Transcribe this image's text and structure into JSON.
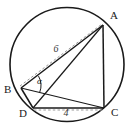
{
  "figure": {
    "type": "cyclic-quadrilateral-inscribed-in-circle",
    "background_color": "#ffffff",
    "stroke_color": "#1a1a1a",
    "dashed_color": "#8a8a8a",
    "circle": {
      "center_x": 67,
      "center_y": 64.5,
      "radius": 57
    },
    "vertices": [
      {
        "id": "A",
        "label": "A",
        "x": 103,
        "y": 25,
        "label_x": 110,
        "label_y": 19
      },
      {
        "id": "B",
        "label": "B",
        "x": 21,
        "y": 88,
        "label_x": 4,
        "label_y": 93
      },
      {
        "id": "C",
        "label": "C",
        "x": 104,
        "y": 108,
        "label_x": 111,
        "label_y": 116
      },
      {
        "id": "D",
        "label": "D",
        "x": 33,
        "y": 108,
        "label_x": 19,
        "label_y": 117
      }
    ],
    "solid_segments": [
      {
        "id": "AB",
        "from": "B",
        "to": "A"
      },
      {
        "id": "AC",
        "from": "A",
        "to": "C"
      },
      {
        "id": "AD",
        "from": "A",
        "to": "D"
      },
      {
        "id": "BD",
        "from": "B",
        "to": "D"
      },
      {
        "id": "BC",
        "from": "B",
        "to": "C"
      },
      {
        "id": "DC",
        "from": "D",
        "to": "C"
      }
    ],
    "dashed_segments": [
      {
        "id": "BA-dashed",
        "from": "B",
        "to": "A",
        "measure": "6"
      },
      {
        "id": "DC-dashed",
        "from": "D",
        "to": "C",
        "measure": "4"
      }
    ],
    "measures": {
      "ba_length": "6",
      "ba_label_x": 56,
      "ba_label_y": 52,
      "dc_length": "4",
      "dc_label_x": 66,
      "dc_label_y": 116
    },
    "angle": {
      "symbol": "α",
      "at_vertex": "B",
      "between": [
        "BA",
        "BC"
      ],
      "label_x": 37,
      "label_y": 84
    }
  }
}
